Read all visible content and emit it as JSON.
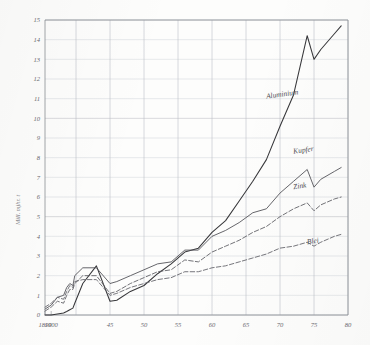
{
  "figure": {
    "background_color": "#fdfdfc",
    "ink_color": "#4a4a4c",
    "grid_color": "#b9bcc2"
  },
  "axis": {
    "y_title": "Mill. mjhr. t",
    "y_ticks": [
      "0",
      "1",
      "2",
      "3",
      "4",
      "5",
      "6",
      "7",
      "8",
      "9",
      "10",
      "11",
      "12",
      "13",
      "14",
      "15"
    ],
    "x_ticks": [
      "1890",
      "1900",
      "45",
      "50",
      "55",
      "60",
      "65",
      "70",
      "75",
      "80"
    ]
  },
  "curve_labels": {
    "aluminium": "Aluminium",
    "kupfer": "Kupfer",
    "zink": "Zink",
    "blei": "Blei"
  },
  "chart_data": {
    "type": "line",
    "title": "",
    "subtitle": "",
    "xlabel": "",
    "ylabel": "Mill. mjhr. t",
    "ylim": [
      0,
      15
    ],
    "xlim": [
      1890,
      1980
    ],
    "grid": true,
    "legend": "inline-right-of-curves",
    "x_tick_values": [
      1890,
      1900,
      1945,
      1950,
      1955,
      1960,
      1965,
      1970,
      1975,
      1980
    ],
    "x_tick_labels": [
      "1890",
      "1900",
      "45",
      "50",
      "55",
      "60",
      "65",
      "70",
      "75",
      "80"
    ],
    "y_tick_values": [
      0,
      1,
      2,
      3,
      4,
      5,
      6,
      7,
      8,
      9,
      10,
      11,
      12,
      13,
      14,
      15
    ],
    "x_axis_note": "pre-1940 span is compressed relative to 1940-1980",
    "series": [
      {
        "name": "Aluminium",
        "style": "solid",
        "color": "#37373a",
        "x": [
          1890,
          1900,
          1910,
          1920,
          1925,
          1930,
          1935,
          1938,
          1941,
          1943,
          1945,
          1946,
          1948,
          1950,
          1952,
          1954,
          1956,
          1958,
          1960,
          1962,
          1964,
          1966,
          1968,
          1970,
          1972,
          1974,
          1975,
          1976,
          1978,
          1979
        ],
        "y": [
          0.0,
          0.0,
          0.05,
          0.1,
          0.18,
          0.27,
          0.35,
          0.6,
          1.6,
          2.5,
          0.7,
          0.75,
          1.2,
          1.5,
          2.1,
          2.6,
          3.2,
          3.4,
          4.2,
          4.8,
          5.8,
          6.8,
          7.9,
          9.6,
          11.2,
          14.2,
          13.0,
          13.5,
          14.3,
          14.7
        ]
      },
      {
        "name": "Kupfer",
        "style": "solid",
        "color": "#55555a",
        "x": [
          1890,
          1900,
          1910,
          1920,
          1925,
          1930,
          1935,
          1938,
          1941,
          1943,
          1945,
          1946,
          1948,
          1950,
          1952,
          1954,
          1956,
          1958,
          1960,
          1962,
          1964,
          1966,
          1968,
          1970,
          1972,
          1974,
          1975,
          1976,
          1978,
          1979
        ],
        "y": [
          0.3,
          0.5,
          0.9,
          1.0,
          1.4,
          1.6,
          1.5,
          2.0,
          2.4,
          2.4,
          1.6,
          1.7,
          2.0,
          2.3,
          2.6,
          2.7,
          3.3,
          3.3,
          4.0,
          4.3,
          4.7,
          5.2,
          5.4,
          6.2,
          6.8,
          7.4,
          6.5,
          6.9,
          7.3,
          7.5
        ]
      },
      {
        "name": "Zink",
        "style": "dashed",
        "color": "#5a5a60",
        "x": [
          1890,
          1900,
          1910,
          1920,
          1925,
          1930,
          1935,
          1938,
          1941,
          1943,
          1945,
          1946,
          1948,
          1950,
          1952,
          1954,
          1956,
          1958,
          1960,
          1962,
          1964,
          1966,
          1968,
          1970,
          1972,
          1974,
          1975,
          1976,
          1978,
          1979
        ],
        "y": [
          0.2,
          0.4,
          0.7,
          0.6,
          1.0,
          1.3,
          1.3,
          1.6,
          2.0,
          2.0,
          1.1,
          1.2,
          1.6,
          1.9,
          2.2,
          2.3,
          2.8,
          2.7,
          3.2,
          3.5,
          3.8,
          4.2,
          4.5,
          5.0,
          5.4,
          5.7,
          5.3,
          5.6,
          5.9,
          6.0
        ]
      },
      {
        "name": "Blei",
        "style": "dashed",
        "color": "#5f5f65",
        "x": [
          1890,
          1900,
          1910,
          1920,
          1925,
          1930,
          1935,
          1938,
          1941,
          1943,
          1945,
          1946,
          1948,
          1950,
          1952,
          1954,
          1956,
          1958,
          1960,
          1962,
          1964,
          1966,
          1968,
          1970,
          1972,
          1974,
          1975,
          1976,
          1978,
          1979
        ],
        "y": [
          0.4,
          0.6,
          0.9,
          0.8,
          1.2,
          1.5,
          1.4,
          1.7,
          1.8,
          1.8,
          1.0,
          1.1,
          1.4,
          1.6,
          1.8,
          1.9,
          2.2,
          2.2,
          2.4,
          2.5,
          2.7,
          2.9,
          3.1,
          3.4,
          3.5,
          3.7,
          3.5,
          3.7,
          4.0,
          4.1
        ]
      }
    ],
    "annotations": [
      {
        "text": "Aluminium",
        "x": 1968,
        "y": 11.0
      },
      {
        "text": "Kupfer",
        "x": 1972,
        "y": 8.2
      },
      {
        "text": "Zink",
        "x": 1972,
        "y": 6.4
      },
      {
        "text": "Blei",
        "x": 1974,
        "y": 3.6
      }
    ]
  }
}
